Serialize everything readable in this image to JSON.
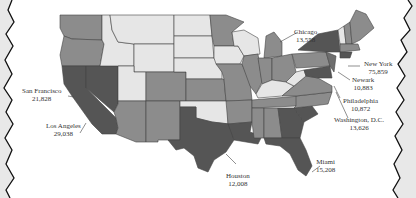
{
  "map": {
    "type": "choropleth",
    "region": "Contiguous United States",
    "colors": {
      "darkest": "#555555",
      "dark": "#6e6e6e",
      "medium": "#8c8c8c",
      "light": "#e6e6e6",
      "border": "#444444",
      "torn_edge": "#111111",
      "torn_fill": "#e8e8e8"
    },
    "cities": [
      {
        "name": "Chicago",
        "value": "13,558"
      },
      {
        "name": "New York",
        "value": "75,859"
      },
      {
        "name": "Newark",
        "value": "10,883"
      },
      {
        "name": "Philadelphia",
        "value": "10,872"
      },
      {
        "name": "Washington, D.C.",
        "value": "13,626"
      },
      {
        "name": "San Francisco",
        "value": "21,828"
      },
      {
        "name": "Los Angeles",
        "value": "29,038"
      },
      {
        "name": "Houston",
        "value": "12,008"
      },
      {
        "name": "Miami",
        "value": "15,208"
      }
    ]
  }
}
